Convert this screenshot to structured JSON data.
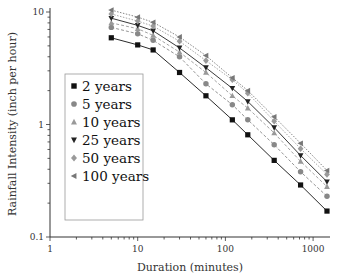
{
  "chart_data": {
    "type": "line",
    "title": "",
    "xlabel": "Duration (minutes)",
    "ylabel": "Rainfall Intensity (inch per hour)",
    "xscale": "log",
    "yscale": "log",
    "xlim": [
      1,
      1500
    ],
    "ylim": [
      0.1,
      10
    ],
    "xticks": [
      1,
      10,
      100,
      1000
    ],
    "xtick_labels": [
      "1",
      "10",
      "100",
      "1000"
    ],
    "yticks": [
      0.1,
      1,
      10
    ],
    "ytick_labels": [
      "0.1",
      "1",
      "10"
    ],
    "grid": false,
    "legend_position": "center-left",
    "x": [
      5,
      10,
      15,
      30,
      60,
      120,
      180,
      360,
      720,
      1440
    ],
    "series": [
      {
        "name": "2 years",
        "marker": "square",
        "color": "#111111",
        "line": "solid",
        "values": [
          5.9,
          5.1,
          4.6,
          2.9,
          1.8,
          1.1,
          0.81,
          0.48,
          0.29,
          0.17
        ]
      },
      {
        "name": "5 years",
        "marker": "circle",
        "color": "#888888",
        "line": "dashed",
        "values": [
          7.3,
          6.4,
          5.6,
          4.0,
          2.3,
          1.5,
          1.1,
          0.66,
          0.38,
          0.23
        ]
      },
      {
        "name": "10 years",
        "marker": "triangle-up",
        "color": "#999999",
        "line": "dashed",
        "values": [
          8.0,
          7.1,
          6.2,
          4.4,
          2.9,
          1.8,
          1.4,
          0.84,
          0.47,
          0.28
        ]
      },
      {
        "name": "25 years",
        "marker": "triangle-down",
        "color": "#222222",
        "line": "solid",
        "values": [
          8.8,
          7.6,
          6.8,
          4.8,
          3.2,
          2.1,
          1.6,
          0.94,
          0.53,
          0.31
        ]
      },
      {
        "name": "50 years",
        "marker": "diamond",
        "color": "#9a9a9a",
        "line": "dotted",
        "values": [
          9.6,
          8.3,
          7.5,
          5.5,
          3.7,
          2.5,
          1.9,
          1.07,
          0.61,
          0.36
        ]
      },
      {
        "name": "100 years",
        "marker": "triangle-left",
        "color": "#777777",
        "line": "dotted",
        "values": [
          10.4,
          9.0,
          8.1,
          6.0,
          4.1,
          2.6,
          2.0,
          1.17,
          0.68,
          0.39
        ]
      }
    ]
  }
}
